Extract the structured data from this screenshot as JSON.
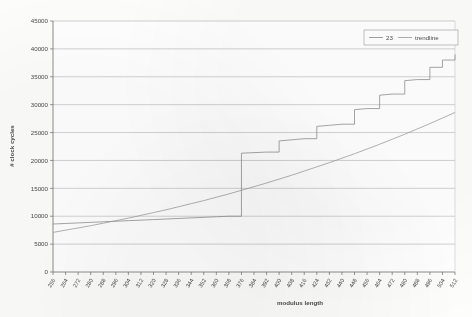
{
  "chart_data": {
    "type": "line",
    "title": "",
    "xlabel": "modulus length",
    "ylabel": "# clock cycles",
    "xlim": [
      256,
      512
    ],
    "ylim": [
      0,
      45000
    ],
    "grid": "horizontal",
    "legend_position": "top-right",
    "ytick_labels": [
      "0",
      "5000",
      "10000",
      "15000",
      "20000",
      "25000",
      "30000",
      "35000",
      "40000",
      "45000"
    ],
    "ytick_values": [
      0,
      5000,
      10000,
      15000,
      20000,
      25000,
      30000,
      35000,
      40000,
      45000
    ],
    "xtick_labels": [
      "256",
      "264",
      "272",
      "280",
      "288",
      "296",
      "304",
      "312",
      "320",
      "328",
      "336",
      "344",
      "352",
      "360",
      "368",
      "376",
      "384",
      "392",
      "400",
      "408",
      "416",
      "424",
      "432",
      "440",
      "448",
      "456",
      "464",
      "472",
      "480",
      "488",
      "496",
      "504",
      "512"
    ],
    "x": [
      256,
      264,
      272,
      280,
      288,
      296,
      304,
      312,
      320,
      328,
      336,
      344,
      352,
      360,
      368,
      376,
      384,
      392,
      400,
      408,
      416,
      424,
      432,
      440,
      448,
      456,
      464,
      472,
      480,
      488,
      496,
      504,
      512
    ],
    "series": [
      {
        "name": "23",
        "color": "#8a8a8a",
        "values": [
          8600,
          8700,
          8800,
          8900,
          9000,
          9100,
          9200,
          9300,
          9400,
          9500,
          9600,
          9700,
          9800,
          9900,
          10000,
          21300,
          21400,
          21500,
          23500,
          23700,
          23900,
          26100,
          26300,
          26500,
          29100,
          29300,
          31700,
          31900,
          34300,
          34500,
          36700,
          38000,
          39000
        ]
      },
      {
        "name": "trendline",
        "color": "#9a9a9a",
        "values": [
          7100,
          7500,
          7900,
          8300,
          8750,
          9200,
          9650,
          10150,
          10650,
          11150,
          11700,
          12250,
          12800,
          13400,
          14000,
          14650,
          15300,
          15950,
          16650,
          17350,
          18100,
          18850,
          19600,
          20400,
          21200,
          22050,
          22900,
          23800,
          24700,
          25650,
          26600,
          27600,
          28600
        ]
      }
    ],
    "legend": [
      {
        "label": "23",
        "color": "#8a8a8a"
      },
      {
        "label": "trendline",
        "color": "#9a9a9a"
      }
    ]
  },
  "axes": {
    "y_axis_title": "# clock cycles",
    "x_axis_title": "modulus length"
  }
}
